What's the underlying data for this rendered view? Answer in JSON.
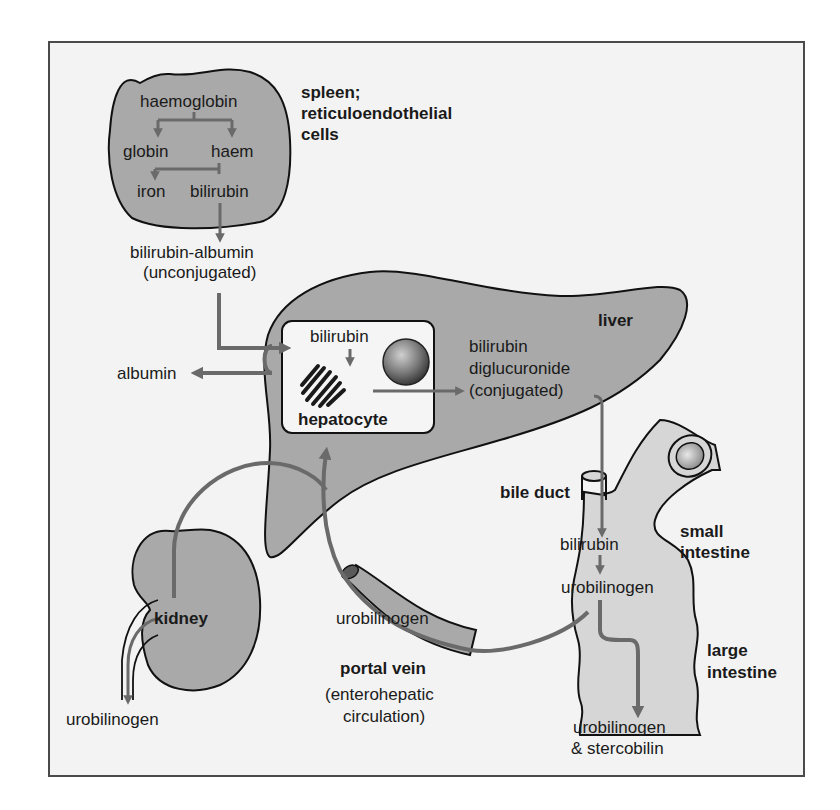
{
  "diagram": {
    "colors": {
      "background": "#f3f3f3",
      "frame_border": "#4a4a4a",
      "organ_fill": "#a9a9a9",
      "intestine_fill": "#d6d6d6",
      "arrow": "#6a6a6a",
      "text": "#1a1a1a"
    },
    "spleen": {
      "heading_line1": "spleen;",
      "heading_line2": "reticuloendothelial",
      "heading_line3": "cells",
      "haemoglobin": "haemoglobin",
      "globin": "globin",
      "haem": "haem",
      "iron": "iron",
      "bilirubin": "bilirubin"
    },
    "blood": {
      "bilirubin_albumin": "bilirubin-albumin",
      "unconjugated": "(unconjugated)",
      "albumin": "albumin"
    },
    "liver": {
      "label": "liver",
      "hepatocyte": {
        "label": "hepatocyte",
        "bilirubin": "bilirubin"
      },
      "conjugated_line1": "bilirubin",
      "conjugated_line2": "diglucuronide",
      "conjugated_line3": "(conjugated)"
    },
    "bile_duct": {
      "label": "bile duct"
    },
    "intestine": {
      "small_line1": "small",
      "small_line2": "intestine",
      "large_line1": "large",
      "large_line2": "intestine",
      "bilirubin": "bilirubin",
      "urobilinogen": "urobilinogen",
      "excreted_line1": "urobilinogen",
      "excreted_line2": "& stercobilin"
    },
    "portal_vein": {
      "urobilinogen": "urobilinogen",
      "label": "portal vein",
      "sub_line1": "(enterohepatic",
      "sub_line2": "circulation)"
    },
    "kidney": {
      "label": "kidney",
      "urobilinogen": "urobilinogen"
    }
  }
}
